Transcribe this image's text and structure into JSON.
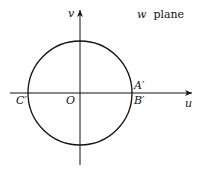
{
  "diagram": {
    "plane_label": {
      "var": "w",
      "word": "plane"
    },
    "axes": {
      "horizontal": "u",
      "vertical": "v"
    },
    "points": {
      "origin": "O",
      "left": "C′",
      "right_upper": "A′",
      "right_lower": "B′"
    },
    "colors": {
      "stroke": "#111111",
      "background": "#ffffff"
    }
  }
}
